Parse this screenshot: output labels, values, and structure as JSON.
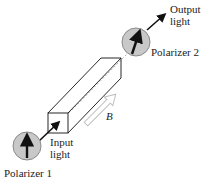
{
  "diagram": {
    "labels": {
      "output_light": [
        "Output",
        "light"
      ],
      "polarizer2": "Polarizer 2",
      "input_light": [
        "Input",
        "light"
      ],
      "polarizer1": "Polarizer 1",
      "field": "B"
    },
    "colors": {
      "polarizer_fill": "#c8c8c8",
      "polarizer_stroke": "#8a8a8a",
      "line": "#111111",
      "hollow_arrow": "#bdbdbd"
    }
  }
}
